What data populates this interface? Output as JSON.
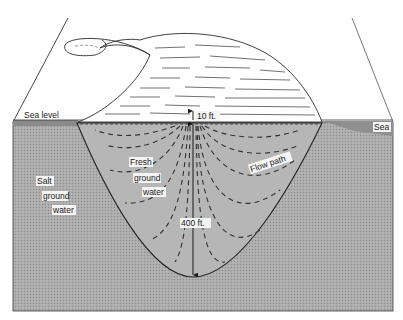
{
  "diagram": {
    "type": "cross-section",
    "labels": {
      "sea_level": "Sea   level",
      "sea": "Sea",
      "salt_1": "Salt",
      "salt_2": "ground",
      "salt_3": "water",
      "fresh_1": "Fresh",
      "fresh_2": "ground",
      "fresh_3": "water",
      "flow_path": "Flow  path",
      "head": "10 ft.",
      "depth": "400 ft."
    },
    "measurements": {
      "water_table_above_sea_level_ft": 10,
      "lens_depth_below_sea_level_ft": 400
    },
    "colors": {
      "background": "#ffffff",
      "salt_water": "#a9a9a9",
      "fresh_water": "#b4b4b4",
      "sea_band": "#8f8f8f",
      "outline": "#2a2a2a",
      "flow_dash": "#333333"
    }
  }
}
